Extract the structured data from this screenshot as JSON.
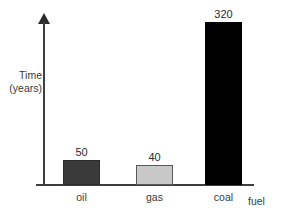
{
  "chart_data": {
    "type": "bar",
    "title": "",
    "xlabel": "fuel",
    "ylabel": "Time (years)",
    "ylabel_lines": [
      "Time",
      "(years)"
    ],
    "categories": [
      "oil",
      "gas",
      "coal"
    ],
    "values": [
      50,
      40,
      320
    ],
    "value_labels": [
      "50",
      "40",
      "320"
    ],
    "ylim": [
      0,
      345
    ],
    "grid": false,
    "legend": null,
    "axis_ticks": [],
    "bar_colors": [
      "#3a3a3a",
      "#c8c8c8",
      "#000000"
    ],
    "bar_border_colors": [
      "#2a2a2a",
      "#5a5a5a",
      "#000000"
    ],
    "axis_color": "#3f3f3f",
    "background_color": "#ffffff",
    "series": [
      {
        "name": "Time (years)",
        "points": [
          {
            "category": "oil",
            "value": 50,
            "label": "50",
            "color": "#3a3a3a"
          },
          {
            "category": "gas",
            "value": 40,
            "label": "40",
            "color": "#c8c8c8"
          },
          {
            "category": "coal",
            "value": 320,
            "label": "320",
            "color": "#000000"
          }
        ]
      }
    ]
  }
}
